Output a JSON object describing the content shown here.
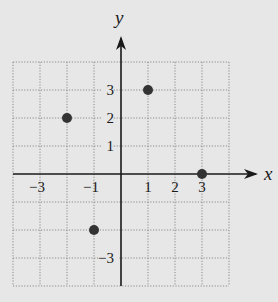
{
  "chart_data": {
    "type": "scatter",
    "title": "",
    "xlabel": "x",
    "ylabel": "y",
    "xlim": [
      -4,
      4
    ],
    "ylim": [
      -4,
      4
    ],
    "grid": true,
    "x_tick_labels": [
      {
        "value": -3,
        "label": "−3"
      },
      {
        "value": -1,
        "label": "−1"
      },
      {
        "value": 1,
        "label": "1"
      },
      {
        "value": 2,
        "label": "2"
      },
      {
        "value": 3,
        "label": "3"
      }
    ],
    "y_tick_labels": [
      {
        "value": 3,
        "label": "3"
      },
      {
        "value": 2,
        "label": "2"
      },
      {
        "value": 1,
        "label": "1"
      },
      {
        "value": -3,
        "label": "−3"
      }
    ],
    "series": [
      {
        "name": "points",
        "points": [
          {
            "x": -2,
            "y": 2
          },
          {
            "x": 1,
            "y": 3
          },
          {
            "x": 3,
            "y": 0
          },
          {
            "x": -1,
            "y": -2
          }
        ]
      }
    ]
  },
  "colors": {
    "background": "#e7e7e7",
    "grid": "#8a8a8a",
    "axis": "#1a1a1a",
    "point": "#333333"
  }
}
